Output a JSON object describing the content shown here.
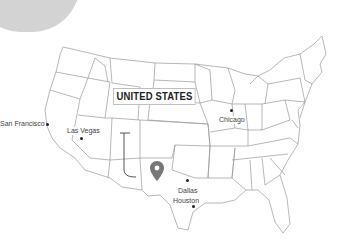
{
  "map": {
    "country_label": "UNITED STATES",
    "marker": {
      "icon": "location-pin-icon",
      "color": "#777777"
    },
    "cities": [
      {
        "name": "San Francisco",
        "label_x": 0,
        "label_y": 123,
        "dot_x": 47,
        "dot_y": 125
      },
      {
        "name": "Las Vegas",
        "label_x": 67,
        "label_y": 129,
        "dot_x": 81,
        "dot_y": 139
      },
      {
        "name": "Chicago",
        "label_x": 219,
        "label_y": 117,
        "dot_x": 231,
        "dot_y": 111
      },
      {
        "name": "Dallas",
        "label_x": 177,
        "label_y": 188,
        "dot_x": 187,
        "dot_y": 180
      },
      {
        "name": "Houston",
        "label_x": 173,
        "label_y": 200,
        "dot_x": 192,
        "dot_y": 207
      }
    ],
    "colors": {
      "state_stroke": "#9a9a9a",
      "overlay_blob": "#d3d3d3",
      "background": "#ffffff"
    }
  }
}
